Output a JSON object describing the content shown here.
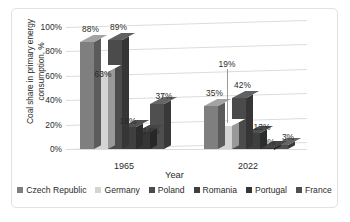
{
  "chart_data": {
    "type": "bar",
    "title": "",
    "subtitle": "",
    "xlabel": "Year",
    "ylabel": "Coal share in primary energy consumption, %",
    "ylabel_line1": "Coal share in primary energy",
    "ylabel_line2": "consumption, %",
    "categories": [
      "1965",
      "2022"
    ],
    "ylim": [
      0,
      100
    ],
    "yticks": [
      "0%",
      "20%",
      "40%",
      "60%",
      "80%",
      "100%"
    ],
    "ytick_values": [
      0,
      20,
      40,
      60,
      80,
      100
    ],
    "grid": true,
    "legend_position": "bottom",
    "three_d": true,
    "series": [
      {
        "name": "Czech Republic",
        "color": "#7f7f7f",
        "values": [
          88,
          35
        ],
        "labels": [
          "88%",
          "35%"
        ]
      },
      {
        "name": "Germany",
        "color": "#d4d4d4",
        "values": [
          63,
          19
        ],
        "labels": [
          "63%",
          "19%"
        ]
      },
      {
        "name": "Poland",
        "color": "#4b4b4b",
        "values": [
          89,
          42
        ],
        "labels": [
          "89%",
          "42%"
        ]
      },
      {
        "name": "Romania",
        "color": "#3f3f3f",
        "values": [
          18,
          13
        ],
        "labels": [
          "18%",
          "13%"
        ]
      },
      {
        "name": "Portugal",
        "color": "#363636",
        "values": [
          14,
          0
        ],
        "labels": [
          "14%",
          "0%"
        ]
      },
      {
        "name": "France",
        "color": "#4f4f4f",
        "values": [
          37,
          3
        ],
        "labels": [
          "37%",
          "3%"
        ]
      }
    ]
  },
  "colors": {
    "frame_border": "#e2e2e2",
    "gridline": "#dcdcdc",
    "text": "#2b2b2b",
    "plot_floor": "#fbfbfb",
    "leader_line": "#9a9a9a"
  }
}
